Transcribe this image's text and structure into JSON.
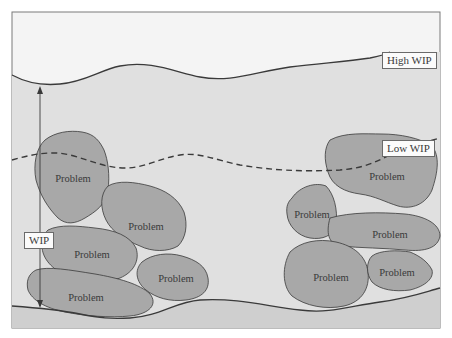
{
  "diagram": {
    "type": "conceptual illustration - inventory water level hides problems",
    "colors": {
      "background": "#ffffff",
      "frame_fill_top": "#f4f4f4",
      "water_fill": "#e0e0e0",
      "rock_fill": "#a8a8a8",
      "floor_fill": "#cfcfcf",
      "line": "#3a3a3a"
    },
    "labels": {
      "high_wip": "High WIP",
      "low_wip": "Low WIP",
      "wip": "WIP"
    },
    "rocks": [
      {
        "label": "Problem",
        "x": 73,
        "y": 178
      },
      {
        "label": "Problem",
        "x": 146,
        "y": 226
      },
      {
        "label": "Problem",
        "x": 92,
        "y": 254
      },
      {
        "label": "Problem",
        "x": 176,
        "y": 278
      },
      {
        "label": "Problem",
        "x": 86,
        "y": 297
      },
      {
        "label": "Problem",
        "x": 387,
        "y": 176
      },
      {
        "label": "Problem",
        "x": 312,
        "y": 214
      },
      {
        "label": "Problem",
        "x": 390,
        "y": 234
      },
      {
        "label": "Problem",
        "x": 331,
        "y": 277
      },
      {
        "label": "Problem",
        "x": 397,
        "y": 272
      }
    ]
  }
}
